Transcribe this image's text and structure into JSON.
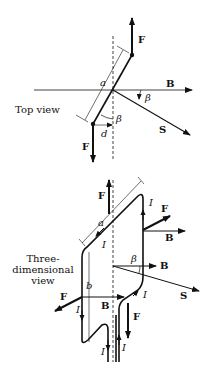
{
  "top_view": {
    "caption": "Top view",
    "labels": {
      "force_top": "F",
      "force_bottom": "F",
      "field": "B",
      "normal": "S",
      "side_length": "a",
      "angle_field": "β",
      "angle_loop": "β",
      "offset": "d"
    }
  },
  "three_d_view": {
    "caption_lines": [
      "Three-",
      "dimensional",
      "view"
    ],
    "labels": {
      "force_top": "F",
      "force_right": "F",
      "force_left": "F",
      "force_bottom": "F",
      "field_right": "B",
      "field_center": "B",
      "field_left": "B",
      "normal": "S",
      "angle": "β",
      "side_a": "a",
      "side_b": "b",
      "current_1": "I",
      "current_2": "I",
      "current_3": "I",
      "current_4": "I",
      "current_5": "I",
      "current_6": "I"
    }
  },
  "colors": {
    "ink": "#111111",
    "background": "#ffffff"
  }
}
